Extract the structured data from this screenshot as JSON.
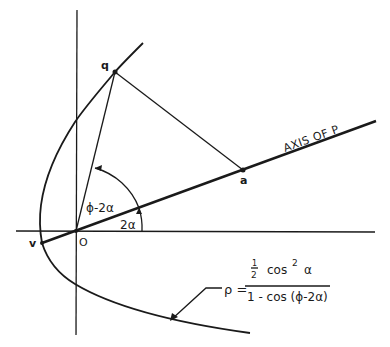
{
  "diagram": {
    "type": "geometric construction (parabola in polar form)",
    "points": {
      "q": "q",
      "a": "a",
      "O": "O",
      "v": "v"
    },
    "labels": {
      "axis": "AXIS OF P",
      "angle_outer": "ϕ-2α",
      "angle_inner": "2α"
    },
    "formula": {
      "lhs": "ρ =",
      "numerator_half_num": "1",
      "numerator_half_den": "2",
      "numerator_rest": "cos",
      "numerator_exp": "2",
      "numerator_var": "α",
      "denominator": "1 - cos (ϕ-2α)"
    },
    "colors": {
      "ink": "#1a1a1a",
      "background": "#ffffff"
    }
  }
}
